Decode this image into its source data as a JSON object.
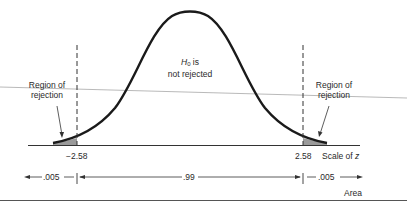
{
  "diagram": {
    "center_label": {
      "hypothesis_symbol": "H",
      "hypothesis_subscript": "0",
      "hypothesis_suffix": " is",
      "line2": "not rejected"
    },
    "left_region_label": {
      "line1": "Region of",
      "line2": "rejection"
    },
    "right_region_label": {
      "line1": "Region of",
      "line2": "rejection"
    },
    "axis": {
      "left_critical": "−2.58",
      "right_critical": "2.58",
      "scale_label_prefix": "Scale of ",
      "scale_label_var": "z"
    },
    "areas": {
      "left_tail": ".005",
      "center": ".99",
      "right_tail": ".005",
      "label": "Area"
    },
    "colors": {
      "curve": "#1a1a1a",
      "shade": "#9a9a9a",
      "lines": "#333333"
    }
  }
}
